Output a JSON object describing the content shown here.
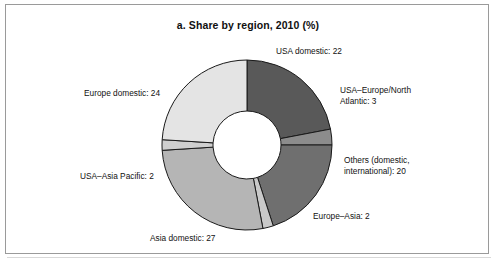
{
  "figure": {
    "title": "a. Share by region, 2010 (%)",
    "background_color": "#ffffff",
    "frame_color": "#9a9a9a"
  },
  "chart_data": {
    "type": "pie",
    "variant": "donut",
    "title": "a. Share by region, 2010 (%)",
    "unit": "%",
    "xlabel": "",
    "ylabel": "",
    "legend_position": "callout-labels",
    "grid": false,
    "start_angle_deg": 0,
    "direction": "clockwise",
    "inner_radius_ratio": 0.4,
    "categories": [
      "USA domestic",
      "USA–Europe/North Atlantic",
      "Others (domestic, international)",
      "Europe–Asia",
      "Asia domestic",
      "USA–Asia Pacific",
      "Europe domestic"
    ],
    "values": [
      22,
      3,
      20,
      2,
      27,
      2,
      24
    ],
    "total": 100,
    "colors": [
      "#595959",
      "#8c8c8c",
      "#6f6f6f",
      "#c9c9c9",
      "#b5b5b5",
      "#cfcfcf",
      "#e4e4e4"
    ],
    "slice_border_color": "#1a1a1a",
    "labels": [
      "USA domestic: 22",
      "USA–Europe/North Atlantic: 3",
      "Others (domestic, international): 20",
      "Europe–Asia: 2",
      "Asia domestic: 27",
      "USA–Asia Pacific: 2",
      "Europe domestic: 24"
    ]
  },
  "callouts": {
    "usa_domestic": "USA domestic: 22",
    "usa_europe_line1": "USA–Europe/North",
    "usa_europe_line2": "Atlantic: 3",
    "others_line1": "Others (domestic,",
    "others_line2": "international): 20",
    "europe_asia": "Europe–Asia: 2",
    "asia_domestic": "Asia domestic: 27",
    "usa_asia_pacific": "USA–Asia Pacific: 2",
    "europe_domestic": "Europe domestic: 24"
  }
}
